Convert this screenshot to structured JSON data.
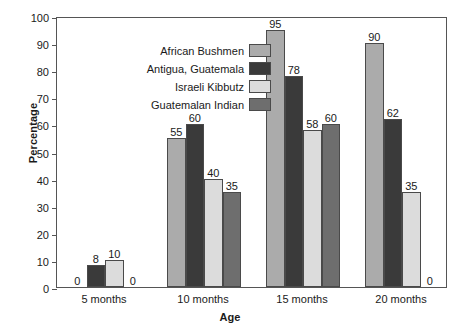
{
  "chart_data": {
    "type": "bar",
    "title": "",
    "xlabel": "Age",
    "ylabel": "Percentage",
    "categories": [
      "5 months",
      "10 months",
      "15 months",
      "20 months"
    ],
    "ylim": [
      0,
      100
    ],
    "yticks": [
      0,
      10,
      20,
      30,
      40,
      50,
      60,
      70,
      80,
      90,
      100
    ],
    "grid": false,
    "legend_position": "top-left-inside",
    "series": [
      {
        "name": "African Bushmen",
        "color": "#ababab",
        "values": [
          0,
          55,
          95,
          90
        ]
      },
      {
        "name": "Antigua, Guatemala",
        "color": "#3a3a3a",
        "values": [
          8,
          60,
          78,
          62
        ]
      },
      {
        "name": "Israeli Kibbutz",
        "color": "#dcdcdc",
        "values": [
          10,
          40,
          58,
          35
        ]
      },
      {
        "name": "Guatemalan Indian",
        "color": "#6e6e6e",
        "values": [
          0,
          35,
          60,
          0
        ]
      }
    ],
    "data_labels": [
      [
        "0",
        "8",
        "10",
        "0"
      ],
      [
        "55",
        "60",
        "40",
        "35"
      ],
      [
        "95",
        "78",
        "58",
        "60"
      ],
      [
        "90",
        "62",
        "35",
        "0"
      ]
    ]
  }
}
